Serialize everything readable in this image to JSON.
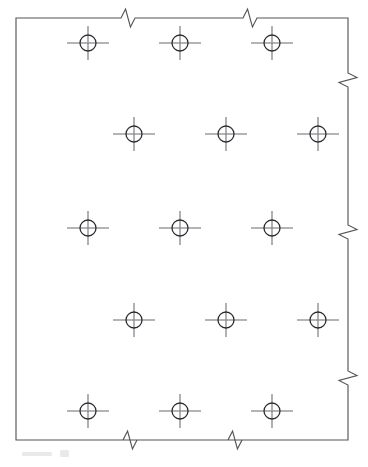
{
  "drawing": {
    "title": "Perforated plate detail with staggered hole pattern",
    "type": "engineering-detail-drawing",
    "canvas": {
      "width": 368,
      "height": 467
    },
    "background_color": "#ffffff",
    "line_color": "#55555a",
    "hole_color": "#2b2b30",
    "centerline_color": "#6a6a70",
    "plate": {
      "name": "plate-outline",
      "left": 16,
      "top": 18,
      "right": 348,
      "bottom": 440,
      "width": 332,
      "height": 422,
      "note": "rectangular plate boundary drawn with conventional break symbols on top, right and bottom edges indicating the part continues beyond the view"
    },
    "break_symbols": {
      "name": "break-line-symbols",
      "count": 7,
      "style": "zigzag-short-break",
      "top_edge": [
        {
          "x": 128,
          "y": 18
        },
        {
          "x": 250,
          "y": 18
        }
      ],
      "right_edge": [
        {
          "x": 348,
          "y": 80
        },
        {
          "x": 348,
          "y": 232
        },
        {
          "x": 348,
          "y": 378
        }
      ],
      "bottom_edge": [
        {
          "x": 130,
          "y": 440
        },
        {
          "x": 235,
          "y": 440
        }
      ]
    },
    "hole_pattern": {
      "name": "staggered-hole-grid",
      "total_holes": 15,
      "rows": 5,
      "columns_per_row": 3,
      "circle_radius": 8,
      "crosshair_half_width": 21,
      "crosshair_half_height": 17,
      "column_pitch": 92,
      "row_pitch": 90,
      "stagger_offset": 46,
      "row_definitions": [
        {
          "row": 1,
          "cy": 43,
          "cx": [
            88,
            180,
            272
          ],
          "alignment": "primary"
        },
        {
          "row": 2,
          "cy": 134,
          "cx": [
            134,
            226,
            318
          ],
          "alignment": "staggered"
        },
        {
          "row": 3,
          "cy": 228,
          "cx": [
            88,
            180,
            272
          ],
          "alignment": "primary"
        },
        {
          "row": 4,
          "cy": 320,
          "cx": [
            134,
            226,
            318
          ],
          "alignment": "staggered"
        },
        {
          "row": 5,
          "cy": 411,
          "cx": [
            88,
            180,
            272
          ],
          "alignment": "primary"
        }
      ]
    },
    "artifacts": {
      "name": "scan-smudge",
      "description": "faint light grey scanning marks below the lower-left edge of the plate",
      "visible": true
    }
  }
}
